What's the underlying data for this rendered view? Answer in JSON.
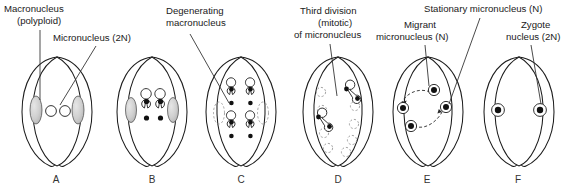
{
  "figure": {
    "width": 581,
    "height": 189,
    "background": "#ffffff",
    "ink_color": "#1c1c1c"
  },
  "labels": [
    {
      "id": "macronucleus",
      "name": "macronucleus-label",
      "line1": "Macronucleus",
      "line2": "(polyploid)",
      "x": 4,
      "y": 12,
      "anchor": "start",
      "leader": "M40,30 L40,100"
    },
    {
      "id": "micronucleus",
      "name": "micronucleus-label",
      "line1": "Micronucleus (2N)",
      "line2": "",
      "x": 53,
      "y": 41,
      "anchor": "start",
      "leader": "M96,46 L60,105"
    },
    {
      "id": "degenerating-macronucleus",
      "name": "degenerating-macronucleus-label",
      "line1": "Degenerating",
      "line2": "macronucleus",
      "x": 166,
      "y": 12,
      "anchor": "start",
      "leader": "M190,32 L228,103"
    },
    {
      "id": "third-division",
      "name": "third-division-label",
      "line1": "Third division",
      "line2": "(mitotic)",
      "line3": "of micronucleus",
      "x": 300,
      "y": 12,
      "anchor": "start",
      "leader": "M330,42 L336,95"
    },
    {
      "id": "migrant-micronucleus",
      "name": "migrant-micronucleus-label",
      "line1": "Migrant",
      "line2": "micronucleus (N)",
      "x": 380,
      "y": 26,
      "anchor": "start",
      "leader": "M425,44 L427,88"
    },
    {
      "id": "stationary-micronucleus",
      "name": "stationary-micronucleus-label",
      "line1": "Stationary micronucleus (N)",
      "line2": "",
      "x": 424,
      "y": 12,
      "anchor": "start",
      "leader": "M478,18 L446,105"
    },
    {
      "id": "zygote-nucleus",
      "name": "zygote-nucleus-label",
      "line1": "Zygote",
      "line2": "nucleus (2N)",
      "x": 512,
      "y": 26,
      "anchor": "start",
      "leader": "M530,44 L513,104"
    }
  ],
  "panels": [
    {
      "id": "A",
      "letter": "A",
      "name": "panel-a",
      "center_x": 57,
      "letter_x": 56,
      "letter_y": 183,
      "caption": "Two conjugating cells with macronucleus and one micronucleus each"
    },
    {
      "id": "B",
      "letter": "B",
      "name": "panel-b",
      "center_x": 152,
      "letter_x": 152,
      "letter_y": 183,
      "caption": "First meiotic division of micronucleus; macronucleus degenerating"
    },
    {
      "id": "C",
      "letter": "C",
      "name": "panel-c",
      "center_x": 241,
      "letter_x": 241,
      "letter_y": 183,
      "caption": "Second meiotic division yielding four haploid micronuclei"
    },
    {
      "id": "D",
      "letter": "D",
      "name": "panel-d",
      "center_x": 338,
      "letter_x": 338,
      "letter_y": 183,
      "caption": "Three micronuclei degenerate; surviving one divides mitotically"
    },
    {
      "id": "E",
      "letter": "E",
      "name": "panel-e",
      "center_x": 428,
      "letter_x": 427,
      "letter_y": 183,
      "caption": "Reciprocal exchange of migrant micronuclei between partners"
    },
    {
      "id": "F",
      "letter": "F",
      "name": "panel-f",
      "center_x": 519,
      "letter_x": 518,
      "letter_y": 183,
      "caption": "Fusion of migrant and stationary nuclei forms diploid zygote nucleus"
    }
  ],
  "legend_terms": {
    "macronucleus": "Macronucleus (polyploid)",
    "micronucleus": "Micronucleus (2N)",
    "degenerating": "Degenerating macronucleus",
    "migrant": "Migrant micronucleus (N)",
    "stationary": "Stationary micronucleus (N)",
    "zygote": "Zygote nucleus (2N)"
  }
}
